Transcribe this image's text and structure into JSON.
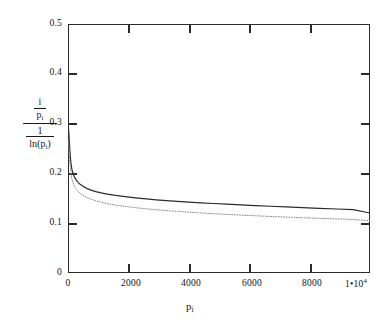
{
  "chart_data": {
    "type": "line",
    "title": "",
    "xlabel": "p_i",
    "ylabel": "(i / p_i) / (1 / ln(p_i))",
    "xlim": [
      0,
      10000
    ],
    "ylim": [
      0,
      0.5
    ],
    "grid": false,
    "legend": "none",
    "xticks": [
      0,
      2000,
      4000,
      6000,
      8000,
      10000
    ],
    "xtick_labels": [
      "0",
      "2000",
      "4000",
      "6000",
      "8000",
      "1•10⁴"
    ],
    "yticks": [
      0,
      0.1,
      0.2,
      0.3,
      0.4,
      0.5
    ],
    "ytick_labels": [
      "0",
      "0.1",
      "0.2",
      "0.3",
      "0.4",
      "0.5"
    ],
    "series": [
      {
        "name": "ratio-solid",
        "style": "solid",
        "color": "#2b2b2b",
        "x": [
          5,
          20,
          40,
          60,
          80,
          100,
          130,
          170,
          210,
          260,
          320,
          400,
          500,
          620,
          760,
          920,
          1100,
          1300,
          1520,
          1760,
          2020,
          2300,
          2600,
          2920,
          3260,
          3620,
          4000,
          4400,
          4820,
          5260,
          5720,
          6200,
          6700,
          7220,
          7760,
          8320,
          8900,
          9440,
          10000
        ],
        "y": [
          0.292,
          0.288,
          0.268,
          0.248,
          0.231,
          0.219,
          0.208,
          0.199,
          0.193,
          0.188,
          0.183,
          0.178,
          0.174,
          0.17,
          0.1665,
          0.1635,
          0.1608,
          0.1583,
          0.1562,
          0.1543,
          0.1524,
          0.1505,
          0.1487,
          0.147,
          0.1454,
          0.144,
          0.1425,
          0.141,
          0.1396,
          0.1382,
          0.1368,
          0.1354,
          0.134,
          0.1326,
          0.1313,
          0.1299,
          0.1285,
          0.1272,
          0.1205
        ]
      },
      {
        "name": "ratio-dotted",
        "style": "dotted",
        "color": "#8a8a8a",
        "x": [
          5,
          20,
          40,
          60,
          80,
          100,
          130,
          170,
          210,
          260,
          320,
          400,
          500,
          620,
          760,
          920,
          1100,
          1300,
          1520,
          1760,
          2020,
          2300,
          2600,
          2920,
          3260,
          3620,
          4000,
          4400,
          4820,
          5260,
          5720,
          6200,
          6700,
          7220,
          7760,
          8320,
          8900,
          9440,
          10000
        ],
        "y": [
          0.268,
          0.258,
          0.24,
          0.223,
          0.209,
          0.199,
          0.189,
          0.181,
          0.175,
          0.17,
          0.165,
          0.16,
          0.1558,
          0.1518,
          0.1482,
          0.145,
          0.1421,
          0.1394,
          0.137,
          0.1348,
          0.1327,
          0.1307,
          0.1288,
          0.127,
          0.1253,
          0.1237,
          0.1221,
          0.1206,
          0.1191,
          0.1177,
          0.1163,
          0.1149,
          0.1136,
          0.1123,
          0.111,
          0.1098,
          0.1086,
          0.1075,
          0.105
        ]
      }
    ]
  },
  "axes": {
    "ylabel_parts": {
      "num_num": "i",
      "num_den": "p",
      "num_den_sub": "i",
      "den_num": "1",
      "den_den_fn": "ln",
      "den_den_arg": "p",
      "den_den_arg_sub": "i"
    },
    "xlabel_parts": {
      "base": "p",
      "sub": "i"
    }
  }
}
